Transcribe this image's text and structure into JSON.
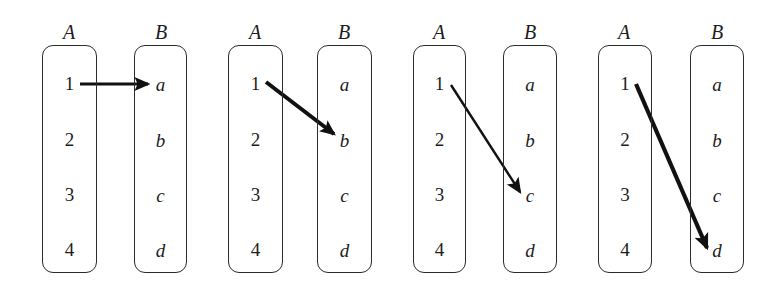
{
  "figure": {
    "width": 777,
    "height": 289,
    "background": "#ffffff",
    "ink_color": "#1c1c1c",
    "box_stroke": "#2b2b2b"
  },
  "panels": [
    {
      "id": "panel-1",
      "source": {
        "label": "A",
        "label_x": 69,
        "label_y": 22,
        "box": {
          "x": 42,
          "y": 45,
          "w": 55,
          "h": 228
        },
        "items": [
          {
            "text": "1",
            "y": 73
          },
          {
            "text": "2",
            "y": 129
          },
          {
            "text": "3",
            "y": 184
          },
          {
            "text": "4",
            "y": 239
          }
        ]
      },
      "target": {
        "label": "B",
        "label_x": 161,
        "label_y": 22,
        "box": {
          "x": 134,
          "y": 45,
          "w": 53,
          "h": 228
        },
        "items": [
          {
            "text": "a",
            "y": 74
          },
          {
            "text": "b",
            "y": 130
          },
          {
            "text": "c",
            "y": 185
          },
          {
            "text": "d",
            "y": 240
          }
        ]
      },
      "arrow": {
        "from_item": "1",
        "to_item": "a",
        "x1": 80,
        "y1": 84,
        "x2": 148,
        "y2": 84,
        "width": 3.2,
        "color": "#111111"
      }
    },
    {
      "id": "panel-2",
      "source": {
        "label": "A",
        "label_x": 255,
        "label_y": 22,
        "box": {
          "x": 228,
          "y": 45,
          "w": 55,
          "h": 228
        },
        "items": [
          {
            "text": "1",
            "y": 73
          },
          {
            "text": "2",
            "y": 129
          },
          {
            "text": "3",
            "y": 184
          },
          {
            "text": "4",
            "y": 239
          }
        ]
      },
      "target": {
        "label": "B",
        "label_x": 344,
        "label_y": 22,
        "box": {
          "x": 317,
          "y": 45,
          "w": 55,
          "h": 228
        },
        "items": [
          {
            "text": "a",
            "y": 74
          },
          {
            "text": "b",
            "y": 130
          },
          {
            "text": "c",
            "y": 185
          },
          {
            "text": "d",
            "y": 240
          }
        ]
      },
      "arrow": {
        "from_item": "1",
        "to_item": "b",
        "x1": 266,
        "y1": 82,
        "x2": 334,
        "y2": 134,
        "width": 4.0,
        "color": "#111111"
      }
    },
    {
      "id": "panel-3",
      "source": {
        "label": "A",
        "label_x": 439,
        "label_y": 22,
        "box": {
          "x": 413,
          "y": 45,
          "w": 53,
          "h": 228
        },
        "items": [
          {
            "text": "1",
            "y": 73
          },
          {
            "text": "2",
            "y": 129
          },
          {
            "text": "3",
            "y": 184
          },
          {
            "text": "4",
            "y": 239
          }
        ]
      },
      "target": {
        "label": "B",
        "label_x": 530,
        "label_y": 22,
        "box": {
          "x": 503,
          "y": 45,
          "w": 54,
          "h": 228
        },
        "items": [
          {
            "text": "a",
            "y": 74
          },
          {
            "text": "b",
            "y": 130
          },
          {
            "text": "c",
            "y": 185
          },
          {
            "text": "d",
            "y": 240
          }
        ]
      },
      "arrow": {
        "from_item": "1",
        "to_item": "c",
        "x1": 451,
        "y1": 85,
        "x2": 520,
        "y2": 192,
        "width": 2.4,
        "color": "#111111"
      }
    },
    {
      "id": "panel-4",
      "source": {
        "label": "A",
        "label_x": 624,
        "label_y": 22,
        "box": {
          "x": 598,
          "y": 45,
          "w": 54,
          "h": 228
        },
        "items": [
          {
            "text": "1",
            "y": 73
          },
          {
            "text": "2",
            "y": 129
          },
          {
            "text": "3",
            "y": 184
          },
          {
            "text": "4",
            "y": 239
          }
        ]
      },
      "target": {
        "label": "B",
        "label_x": 717,
        "label_y": 22,
        "box": {
          "x": 690,
          "y": 45,
          "w": 54,
          "h": 228
        },
        "items": [
          {
            "text": "a",
            "y": 74
          },
          {
            "text": "b",
            "y": 130
          },
          {
            "text": "c",
            "y": 185
          },
          {
            "text": "d",
            "y": 240
          }
        ]
      },
      "arrow": {
        "from_item": "1",
        "to_item": "d",
        "x1": 636,
        "y1": 84,
        "x2": 707,
        "y2": 248,
        "width": 4.2,
        "color": "#111111"
      }
    }
  ]
}
